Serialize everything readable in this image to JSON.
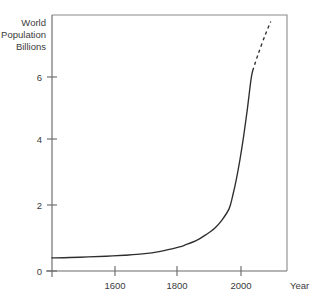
{
  "chart_data": {
    "type": "line",
    "title": "",
    "subtitle": "",
    "xlabel": "Year",
    "ylabel": "World Population Billions",
    "ylabel_lines": [
      "World",
      "Population",
      "Billions"
    ],
    "xlim": [
      1450,
      2100
    ],
    "ylim": [
      0,
      7.8
    ],
    "grid": false,
    "legend": null,
    "x_ticks": [
      1600,
      1800,
      2000
    ],
    "x_tick_labels": [
      "1600",
      "1800",
      "2000"
    ],
    "y_ticks": [
      0,
      2,
      4,
      6
    ],
    "y_tick_labels": [
      "0",
      "2",
      "4",
      "6"
    ],
    "series": [
      {
        "name": "World population (historical)",
        "style": "solid",
        "x": [
          1450,
          1500,
          1550,
          1600,
          1650,
          1700,
          1750,
          1800,
          1820,
          1850,
          1875,
          1900,
          1920,
          1940,
          1950,
          1960,
          1970,
          1980,
          1990,
          2000,
          2005
        ],
        "values": [
          0.4,
          0.41,
          0.43,
          0.45,
          0.48,
          0.52,
          0.6,
          0.73,
          0.8,
          0.93,
          1.1,
          1.3,
          1.55,
          1.9,
          2.3,
          2.8,
          3.4,
          4.1,
          4.9,
          5.8,
          6.1
        ]
      },
      {
        "name": "World population (projection)",
        "style": "dashed",
        "x": [
          2005,
          2020,
          2040,
          2055
        ],
        "values": [
          6.1,
          6.6,
          7.2,
          7.6
        ]
      }
    ],
    "annotations": []
  },
  "labels": {
    "ylabel_line1": "World",
    "ylabel_line2": "Population",
    "ylabel_line3": "Billions",
    "xaxis_title": "Year",
    "ytick_0": "0",
    "ytick_2": "2",
    "ytick_4": "4",
    "ytick_6": "6",
    "xtick_1600": "1600",
    "xtick_1800": "1800",
    "xtick_2000": "2000"
  },
  "colors": {
    "curve": "#2e2e2e",
    "axis": "#6b6b6b",
    "frame": "#8a8a8a",
    "text": "#3b3b3b",
    "background": "#ffffff"
  }
}
